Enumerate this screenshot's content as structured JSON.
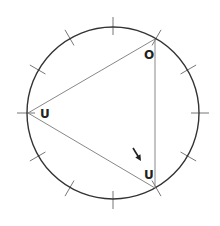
{
  "diagram": {
    "circle": {
      "cx": 113,
      "cy": 113,
      "r": 86,
      "stroke": "#333333"
    },
    "ticks": {
      "count": 12,
      "inner": 78,
      "outer": 96,
      "stroke": "#777777"
    },
    "triangle": {
      "stroke": "#888888",
      "vertices": [
        {
          "name": "top-right",
          "x": 155,
          "y": 39
        },
        {
          "name": "left",
          "x": 28,
          "y": 113
        },
        {
          "name": "bottom-right",
          "x": 155,
          "y": 188
        }
      ]
    },
    "labels": [
      {
        "text": "O",
        "x": 144,
        "y": 59
      },
      {
        "text": "U",
        "x": 40,
        "y": 118
      },
      {
        "text": "U",
        "x": 144,
        "y": 179
      }
    ],
    "arrow": {
      "x1": 133,
      "y1": 148,
      "x2": 141,
      "y2": 161,
      "direction": "down-right"
    }
  }
}
